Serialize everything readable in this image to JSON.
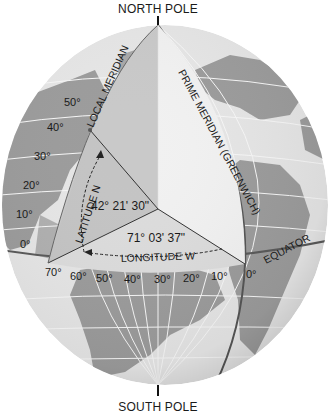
{
  "poles": {
    "north": "NORTH POLE",
    "south": "SOUTH POLE"
  },
  "meridians": {
    "local": "LOCAL MERIDIAN",
    "prime": "PRIME MERIDIAN (GREENWICH)"
  },
  "equator_label": "EQUATOR",
  "latitude": {
    "label": "LATITUDE N",
    "value": "42° 21' 30\""
  },
  "longitude": {
    "label": "LONGITUDE W",
    "value": "71° 03' 37\""
  },
  "latitude_ticks": [
    "50°",
    "40°",
    "30°",
    "20°",
    "10°",
    "0°"
  ],
  "longitude_ticks": [
    "70°",
    "60°",
    "50°",
    "40°",
    "30°",
    "20°",
    "10°",
    "0°"
  ],
  "colors": {
    "ocean": "#e6e6e6",
    "land": "#9a9a9a",
    "grid": "#f7f7f7",
    "wedge_left": "#c9c9c9",
    "wedge_right": "#f1f1f1",
    "wedge_floor": "#dcdcdc",
    "lines": "#333333"
  }
}
